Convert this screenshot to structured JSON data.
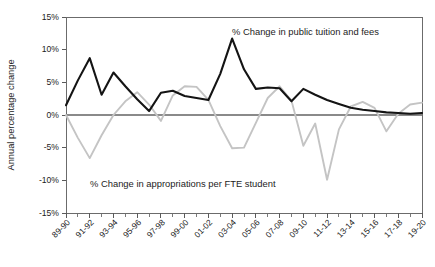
{
  "chart_data": {
    "type": "line",
    "title": "",
    "xlabel": "",
    "ylabel": "Annual percentage change",
    "ylim": [
      -15,
      15
    ],
    "ytick_labels": [
      "15%",
      "10%",
      "5%",
      "0%",
      "-5%",
      "-10%",
      "-15%"
    ],
    "ytick_values": [
      15,
      10,
      5,
      0,
      -5,
      -10,
      -15
    ],
    "grid": false,
    "legend_position": "inline-annotations",
    "categories": [
      "89-90",
      "90-91",
      "91-92",
      "92-93",
      "93-94",
      "94-95",
      "95-96",
      "96-97",
      "97-98",
      "98-99",
      "99-00",
      "00-01",
      "01-02",
      "02-03",
      "03-04",
      "04-05",
      "05-06",
      "06-07",
      "07-08",
      "08-09",
      "09-10",
      "10-11",
      "11-12",
      "12-13",
      "13-14",
      "14-15",
      "15-16",
      "16-17",
      "17-18",
      "18-19",
      "19-20"
    ],
    "xtick_labels": [
      "89-90",
      "91-92",
      "93-94",
      "95-96",
      "97-98",
      "99-00",
      "01-02",
      "03-04",
      "05-06",
      "07-08",
      "09-10",
      "11-12",
      "13-14",
      "15-16",
      "17-18",
      "19-20"
    ],
    "xtick_label_indices": [
      0,
      2,
      4,
      6,
      8,
      10,
      12,
      14,
      16,
      18,
      20,
      22,
      24,
      26,
      28,
      30
    ],
    "series": [
      {
        "name": "% Change in public tuition and fees",
        "color": "#141414",
        "annotation": "% Change in public tuition and fees",
        "values": [
          1.5,
          5.3,
          8.7,
          3.1,
          6.5,
          4.4,
          2.4,
          0.6,
          3.4,
          3.7,
          2.9,
          2.6,
          2.3,
          6.3,
          11.7,
          7.0,
          4.0,
          4.2,
          4.1,
          2.1,
          4.0,
          3.1,
          2.3,
          1.7,
          1.1,
          0.8,
          0.6,
          0.4,
          0.3,
          0.2,
          0.3
        ]
      },
      {
        "name": "% Change in appropriations per FTE student",
        "color": "#c4c4c4",
        "annotation": "% Change in appropriations per FTE student",
        "values": [
          0.0,
          -3.5,
          -6.6,
          -3.1,
          0.0,
          2.1,
          3.5,
          1.6,
          -0.9,
          3.0,
          4.4,
          4.3,
          2.3,
          -1.7,
          -5.1,
          -5.0,
          -1.2,
          2.6,
          4.4,
          2.2,
          -4.7,
          -1.3,
          -9.9,
          -2.2,
          1.3,
          2.0,
          1.1,
          -2.5,
          0.2,
          1.6,
          1.9
        ]
      }
    ],
    "annotations": [
      {
        "text": "% Change in public tuition and fees",
        "x_px": 232,
        "y_px": 35
      },
      {
        "text": "% Change in appropriations per FTE student",
        "x_px": 90,
        "y_px": 187
      }
    ]
  }
}
